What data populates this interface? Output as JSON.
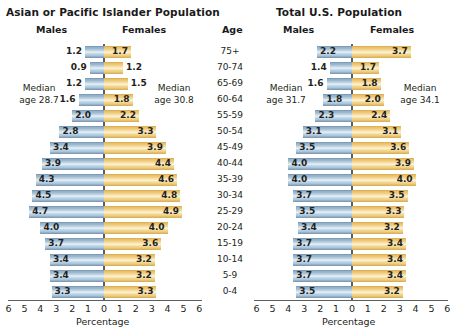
{
  "age_header": "Age",
  "age_groups": [
    "75+",
    "70-74",
    "65-69",
    "60-64",
    "55-59",
    "50-54",
    "45-49",
    "40-44",
    "35-39",
    "30-34",
    "25-29",
    "20-24",
    "15-19",
    "10-14",
    "5-9",
    "0-4"
  ],
  "axis": {
    "title": "Percentage",
    "ticks_left": [
      "6",
      "5",
      "4",
      "3",
      "2",
      "1",
      "0"
    ],
    "ticks_right": [
      "0",
      "1",
      "2",
      "3",
      "4",
      "5",
      "6"
    ],
    "max": 6
  },
  "labels": {
    "males": "Males",
    "females": "Females",
    "median_prefix": "Median",
    "age_prefix": "age"
  },
  "colors": {
    "male_bar": "#a9c3d8",
    "female_bar": "#f0cb78",
    "axis": "#5a5f66",
    "text": "#231f20"
  },
  "panels": [
    {
      "id": "asian-pacific-islander",
      "title": "Asian or Pacific Islander Population",
      "median_male": "Median age 28.7",
      "median_male_line1": "Median",
      "median_male_line2": "age 28.7",
      "median_female_line1": "Median",
      "median_female_line2": "age 30.8",
      "median_female": "Median age 30.8",
      "males": [
        1.2,
        0.9,
        1.2,
        1.6,
        2.0,
        2.8,
        3.4,
        3.9,
        4.3,
        4.5,
        4.7,
        4.0,
        3.7,
        3.4,
        3.4,
        3.3
      ],
      "females": [
        1.7,
        1.2,
        1.5,
        1.8,
        2.2,
        3.3,
        3.9,
        4.4,
        4.6,
        4.8,
        4.9,
        4.0,
        3.6,
        3.2,
        3.2,
        3.3
      ],
      "male_labels": [
        "1.2",
        "0.9",
        "1.2",
        "1.6",
        "2.0",
        "2.8",
        "3.4",
        "3.9",
        "4.3",
        "4.5",
        "4.7",
        "4.0",
        "3.7",
        "3.4",
        "3.4",
        "3.3"
      ],
      "female_labels": [
        "1.7",
        "1.2",
        "1.5",
        "1.8",
        "2.2",
        "3.3",
        "3.9",
        "4.4",
        "4.6",
        "4.8",
        "4.9",
        "4.0",
        "3.6",
        "3.2",
        "3.2",
        "3.3"
      ]
    },
    {
      "id": "total-us",
      "title": "Total U.S. Population",
      "median_male": "Median age 31.7",
      "median_male_line1": "Median",
      "median_male_line2": "age 31.7",
      "median_female_line1": "Median",
      "median_female_line2": "age 34.1",
      "median_female": "Median age 34.1",
      "males": [
        2.2,
        1.4,
        1.6,
        1.8,
        2.3,
        3.1,
        3.5,
        4.0,
        4.0,
        3.7,
        3.5,
        3.4,
        3.7,
        3.7,
        3.7,
        3.5
      ],
      "females": [
        3.7,
        1.7,
        1.8,
        2.0,
        2.4,
        3.1,
        3.6,
        3.9,
        4.0,
        3.5,
        3.3,
        3.2,
        3.4,
        3.4,
        3.4,
        3.2
      ],
      "male_labels": [
        "2.2",
        "1.4",
        "1.6",
        "1.8",
        "2.3",
        "3.1",
        "3.5",
        "4.0",
        "4.0",
        "3.7",
        "3.5",
        "3.4",
        "3.7",
        "3.7",
        "3.7",
        "3.5"
      ],
      "female_labels": [
        "3.7",
        "1.7",
        "1.8",
        "2.0",
        "2.4",
        "3.1",
        "3.6",
        "3.9",
        "4.0",
        "3.5",
        "3.3",
        "3.2",
        "3.4",
        "3.4",
        "3.4",
        "3.2"
      ]
    }
  ],
  "chart_data": {
    "type": "bar",
    "subtype": "population-pyramid",
    "xlabel": "Percentage",
    "ylabel": "Age",
    "xlim": [
      -6,
      6
    ],
    "xticks": [
      6,
      5,
      4,
      3,
      2,
      1,
      0,
      1,
      2,
      3,
      4,
      5,
      6
    ],
    "grid": false,
    "legend": "none",
    "categories": [
      "75+",
      "70-74",
      "65-69",
      "60-64",
      "55-59",
      "50-54",
      "45-49",
      "40-44",
      "35-39",
      "30-34",
      "25-29",
      "20-24",
      "15-19",
      "10-14",
      "5-9",
      "0-4"
    ],
    "panels": [
      {
        "name": "Asian or Pacific Islander Population",
        "median_age_males": 28.7,
        "median_age_females": 30.8,
        "series": [
          {
            "name": "Males",
            "values": [
              1.2,
              0.9,
              1.2,
              1.6,
              2.0,
              2.8,
              3.4,
              3.9,
              4.3,
              4.5,
              4.7,
              4.0,
              3.7,
              3.4,
              3.4,
              3.3
            ]
          },
          {
            "name": "Females",
            "values": [
              1.7,
              1.2,
              1.5,
              1.8,
              2.2,
              3.3,
              3.9,
              4.4,
              4.6,
              4.8,
              4.9,
              4.0,
              3.6,
              3.2,
              3.2,
              3.3
            ]
          }
        ]
      },
      {
        "name": "Total U.S. Population",
        "median_age_males": 31.7,
        "median_age_females": 34.1,
        "series": [
          {
            "name": "Males",
            "values": [
              2.2,
              1.4,
              1.6,
              1.8,
              2.3,
              3.1,
              3.5,
              4.0,
              4.0,
              3.7,
              3.5,
              3.4,
              3.7,
              3.7,
              3.7,
              3.5
            ]
          },
          {
            "name": "Females",
            "values": [
              3.7,
              1.7,
              1.8,
              2.0,
              2.4,
              3.1,
              3.6,
              3.9,
              4.0,
              3.5,
              3.3,
              3.2,
              3.4,
              3.4,
              3.4,
              3.2
            ]
          }
        ]
      }
    ]
  }
}
